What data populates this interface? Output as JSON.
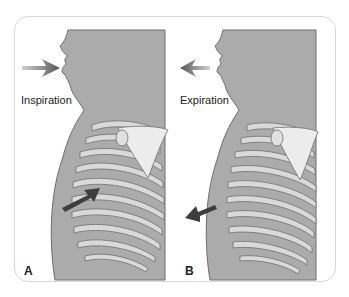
{
  "figure": {
    "panels": [
      {
        "letter": "A",
        "caption": "Inspiration",
        "airflow": "in"
      },
      {
        "letter": "B",
        "caption": "Expiration",
        "airflow": "out"
      }
    ],
    "colors": {
      "body_fill": "#ababab",
      "body_stroke": "#6e6e6e",
      "rib_fill": "#d9d9d9",
      "cartilage_fill": "#f2f2f2",
      "arrow": "#5a5a5a",
      "frame_border": "#d8d8d8"
    }
  }
}
